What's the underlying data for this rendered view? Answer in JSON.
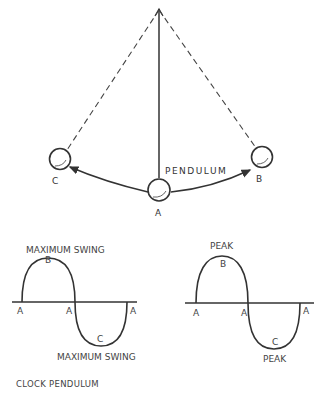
{
  "pendulum": {
    "label": "PENDULUM",
    "positions": {
      "left": "C",
      "center": "A",
      "right": "B"
    }
  },
  "left_wave": {
    "top_label": "MAXIMUM SWING",
    "bottom_label": "MAXIMUM SWING",
    "peak_label": "B",
    "trough_label": "C",
    "axis_labels": [
      "A",
      "A",
      "A"
    ]
  },
  "right_wave": {
    "top_label": "PEAK",
    "bottom_label": "PEAK",
    "peak_label": "B",
    "trough_label": "C",
    "axis_labels": [
      "A",
      "A",
      "A"
    ]
  },
  "caption": "CLOCK PENDULUM",
  "colors": {
    "line": "#333333",
    "background": "#ffffff"
  }
}
